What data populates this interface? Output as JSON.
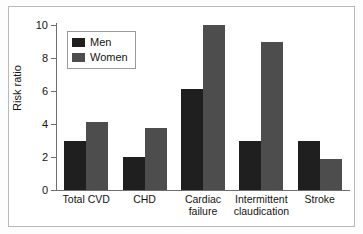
{
  "chart_data": {
    "type": "bar",
    "title": "",
    "subtitle": "",
    "xlabel": "",
    "ylabel": "Risk ratio",
    "ylim": [
      0,
      10
    ],
    "yticks": [
      0,
      2,
      4,
      6,
      8,
      10
    ],
    "ytick_labels": [
      "0",
      "2",
      "4",
      "6",
      "8",
      "10"
    ],
    "grid": false,
    "legend_position": "upper-left-inside",
    "categories": [
      "Total CVD",
      "CHD",
      "Cardiac failure",
      "Intermittent claudication",
      "Stroke"
    ],
    "category_label_lines": [
      [
        "Total CVD"
      ],
      [
        "CHD"
      ],
      [
        "Cardiac",
        "failure"
      ],
      [
        "Intermittent",
        "claudication"
      ],
      [
        "Stroke"
      ]
    ],
    "series": [
      {
        "name": "Men",
        "color": "#1f1f1f",
        "values": [
          3.0,
          2.0,
          6.1,
          3.0,
          3.0
        ]
      },
      {
        "name": "Women",
        "color": "#4d4d4d",
        "values": [
          4.1,
          3.75,
          10.0,
          9.0,
          1.9
        ]
      }
    ]
  },
  "legend": {
    "items": [
      {
        "label": "Men",
        "swatch": "men-swatch"
      },
      {
        "label": "Women",
        "swatch": "women-swatch"
      }
    ]
  },
  "axes": {
    "y_title": "Risk ratio"
  },
  "colors": {
    "men": "#1f1f1f",
    "women": "#4d4d4d",
    "axis": "#6e6e6e",
    "frame": "#b9b9b9",
    "text": "#141414",
    "background": "#ffffff"
  }
}
